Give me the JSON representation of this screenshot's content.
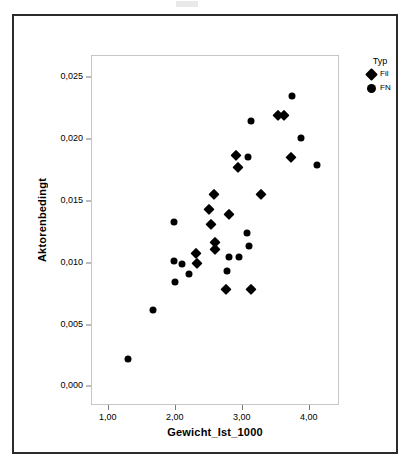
{
  "chart_data": {
    "type": "scatter",
    "title": "",
    "xlabel": "Gewicht_Ist_1000",
    "ylabel": "Aktorenbedingt",
    "xlim": [
      0.75,
      4.45
    ],
    "ylim": [
      -0.0015,
      0.0268
    ],
    "grid": false,
    "legend": {
      "title": "Typ",
      "position": "top-right",
      "entries": [
        {
          "label": "Fil",
          "marker": "diamond"
        },
        {
          "label": "FN",
          "marker": "circle"
        }
      ]
    },
    "x_ticks": [
      {
        "value": 1.0,
        "label": "1,00"
      },
      {
        "value": 2.0,
        "label": "2,00"
      },
      {
        "value": 3.0,
        "label": "3,00"
      },
      {
        "value": 4.0,
        "label": "4,00"
      }
    ],
    "y_ticks": [
      {
        "value": 0.0,
        "label": "0,000"
      },
      {
        "value": 0.005,
        "label": "0,005"
      },
      {
        "value": 0.01,
        "label": "0,010"
      },
      {
        "value": 0.015,
        "label": "0,015"
      },
      {
        "value": 0.02,
        "label": "0,020"
      },
      {
        "value": 0.025,
        "label": "0,025"
      }
    ],
    "series": [
      {
        "name": "Fil",
        "marker": "diamond",
        "points": [
          [
            2.3,
            0.0109
          ],
          [
            2.32,
            0.0101
          ],
          [
            2.5,
            0.0144
          ],
          [
            2.52,
            0.0132
          ],
          [
            2.57,
            0.01565
          ],
          [
            2.58,
            0.0118
          ],
          [
            2.59,
            0.0112
          ],
          [
            2.75,
            0.008
          ],
          [
            2.79,
            0.014
          ],
          [
            2.9,
            0.0188
          ],
          [
            2.93,
            0.0178
          ],
          [
            3.12,
            0.008
          ],
          [
            3.27,
            0.01565
          ],
          [
            3.52,
            0.02205
          ],
          [
            3.62,
            0.02205
          ],
          [
            3.72,
            0.01865
          ]
        ]
      },
      {
        "name": "FN",
        "marker": "circle",
        "points": [
          [
            1.29,
            0.0023
          ],
          [
            1.66,
            0.0063
          ],
          [
            1.97,
            0.0134
          ],
          [
            1.98,
            0.01025
          ],
          [
            1.99,
            0.0085
          ],
          [
            2.1,
            0.00995
          ],
          [
            2.2,
            0.00915
          ],
          [
            2.76,
            0.00945
          ],
          [
            2.79,
            0.01055
          ],
          [
            2.94,
            0.01055
          ],
          [
            3.06,
            0.0125
          ],
          [
            3.09,
            0.01145
          ],
          [
            3.08,
            0.01865
          ],
          [
            3.12,
            0.02155
          ],
          [
            3.73,
            0.02355
          ],
          [
            3.87,
            0.02015
          ],
          [
            4.11,
            0.01795
          ]
        ]
      }
    ]
  }
}
